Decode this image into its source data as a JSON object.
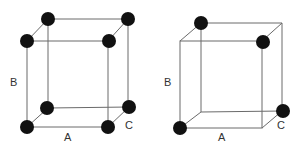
{
  "diagrams": [
    {
      "name": "cube-left",
      "labels": {
        "height": "B",
        "width": "A",
        "depth": "C"
      },
      "atoms_on": [
        "btl",
        "btr",
        "ftl",
        "ftr",
        "bbl",
        "bbr",
        "fbl",
        "fbr"
      ]
    },
    {
      "name": "cube-right",
      "labels": {
        "height": "B",
        "width": "A",
        "depth": "C"
      },
      "atoms_on": [
        "btl",
        "ftr",
        "bbr",
        "fbl"
      ]
    }
  ],
  "colors": {
    "edge": "#6a6a6a",
    "atom": "#111111",
    "label": "#333333"
  }
}
